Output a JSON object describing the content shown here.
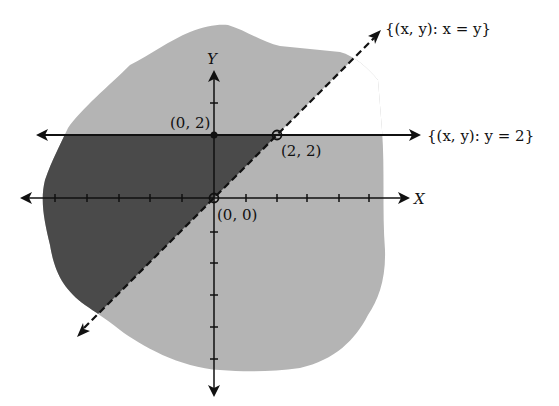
{
  "figure": {
    "type": "graph of inequality regions",
    "axes": {
      "x_label": "X",
      "y_label": "Y",
      "x_ticks_left": 5,
      "x_ticks_right": 5,
      "y_ticks_up": 1,
      "y_ticks_down": 5
    },
    "lines": [
      {
        "id": "diagonal",
        "label": "{(x, y): x = y}",
        "style": "dashed",
        "equation": "x = y"
      },
      {
        "id": "horizontal",
        "label": "{(x, y): y = 2}",
        "style": "solid",
        "equation": "y = 2"
      }
    ],
    "points": [
      {
        "label": "(0, 2)",
        "x": 0,
        "y": 2,
        "marker": "filled"
      },
      {
        "label": "(2, 2)",
        "x": 2,
        "y": 2,
        "marker": "open"
      },
      {
        "label": "(0, 0)",
        "x": 0,
        "y": 0,
        "marker": "open"
      }
    ],
    "regions": [
      {
        "id": "dark",
        "description": "y < 2 and y > x",
        "color": "#4a4a4a"
      },
      {
        "id": "light",
        "description": "remaining shaded blob",
        "color": "#b4b4b4"
      }
    ],
    "colors": {
      "background": "#ffffff",
      "light_region": "#b4b4b4",
      "dark_region": "#4a4a4a",
      "ink": "#111111"
    }
  }
}
